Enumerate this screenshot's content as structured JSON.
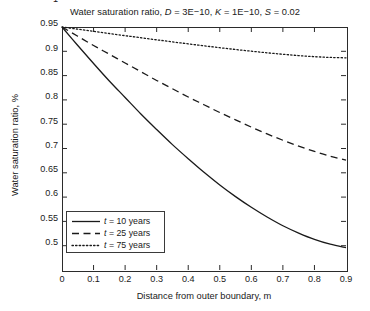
{
  "chart_data": {
    "type": "line",
    "title": "Water saturation ratio, D = 3E−10, K = 1E−10, S = 0.02",
    "title_parts": {
      "main": "Water saturation ratio,",
      "d_symbol": "D",
      "d_value": " = 3E−10,",
      "k_symbol": "K",
      "k_value": " = 1E−10,",
      "s_symbol": "S",
      "s_value": " = 0.02"
    },
    "xlabel": "Distance from outer boundary, m",
    "ylabel": "Water saturation ratio, %",
    "xlim": [
      0,
      0.9
    ],
    "ylim": [
      0.5,
      1.0
    ],
    "grid": false,
    "legend_position": "lower left",
    "xticks": [
      "0",
      "0.1",
      "0.2",
      "0.3",
      "0.4",
      "0.5",
      "0.6",
      "0.7",
      "0.8",
      "0.9"
    ],
    "xtick_values": [
      0,
      0.1,
      0.2,
      0.3,
      0.4,
      0.5,
      0.6,
      0.7,
      0.8,
      0.9
    ],
    "yticks": [
      "0.5",
      "0.55",
      "0.6",
      "0.65",
      "0.7",
      "0.75",
      "0.8",
      "0.85",
      "0.9",
      "0.95",
      "1"
    ],
    "ytick_values": [
      0.5,
      0.55,
      0.6,
      0.65,
      0.7,
      0.75,
      0.8,
      0.85,
      0.9,
      0.95,
      1.0
    ],
    "x": [
      0,
      0.05,
      0.1,
      0.15,
      0.2,
      0.25,
      0.3,
      0.35,
      0.4,
      0.45,
      0.5,
      0.55,
      0.6,
      0.65,
      0.7,
      0.75,
      0.8,
      0.85,
      0.9
    ],
    "series": [
      {
        "name": "t = 10 years",
        "label_symbol": "t",
        "label_rest": " = 10 years",
        "style": "solid",
        "color": "#1a1a1a",
        "values": [
          1.0,
          0.962,
          0.925,
          0.889,
          0.855,
          0.821,
          0.789,
          0.758,
          0.729,
          0.701,
          0.675,
          0.651,
          0.629,
          0.609,
          0.591,
          0.576,
          0.563,
          0.553,
          0.546
        ]
      },
      {
        "name": "t = 25 years",
        "label_symbol": "t",
        "label_rest": " = 25 years",
        "style": "dashed",
        "color": "#1a1a1a",
        "values": [
          1.0,
          0.981,
          0.962,
          0.944,
          0.926,
          0.908,
          0.89,
          0.873,
          0.856,
          0.84,
          0.824,
          0.809,
          0.794,
          0.78,
          0.767,
          0.755,
          0.744,
          0.734,
          0.726
        ]
      },
      {
        "name": "t = 75 years",
        "label_symbol": "t",
        "label_rest": " = 75 years",
        "style": "dotted",
        "color": "#1a1a1a",
        "values": [
          1.0,
          0.9955,
          0.991,
          0.9866,
          0.9822,
          0.9779,
          0.9736,
          0.9694,
          0.9653,
          0.9613,
          0.9574,
          0.9537,
          0.9502,
          0.9469,
          0.9439,
          0.9412,
          0.939,
          0.9374,
          0.9366
        ]
      }
    ]
  }
}
